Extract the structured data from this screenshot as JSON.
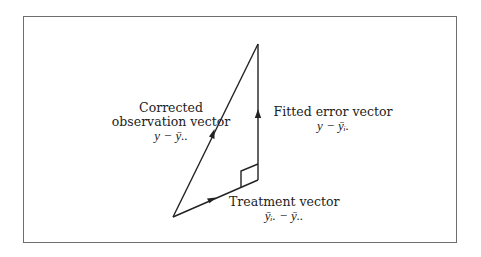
{
  "diagram": {
    "labels": {
      "corrected": {
        "line1": "Corrected",
        "line2": "observation vector",
        "formula": "y − ȳ.."
      },
      "fitted_error": {
        "line1": "Fitted error vector",
        "formula": "y − ȳᵢ."
      },
      "treatment": {
        "line1": "Treatment vector",
        "formula": "ȳᵢ. − ȳ.."
      }
    },
    "vertices": {
      "origin": [
        173,
        217
      ],
      "right_angle": [
        258,
        180
      ],
      "top": [
        258,
        44
      ]
    },
    "edges": [
      {
        "name": "treatment-vector",
        "from": "origin",
        "to": "right_angle",
        "arrow_at": [
          212,
          199
        ]
      },
      {
        "name": "fitted-error-vector",
        "from": "right_angle",
        "to": "top",
        "arrow_at": [
          258,
          114
        ]
      },
      {
        "name": "corrected-observation-vector",
        "from": "origin",
        "to": "top",
        "arrow_at": [
          212,
          134
        ]
      }
    ],
    "colors": {
      "line": "#222222",
      "frame": "#6e6e6e",
      "text": "#222222"
    }
  }
}
